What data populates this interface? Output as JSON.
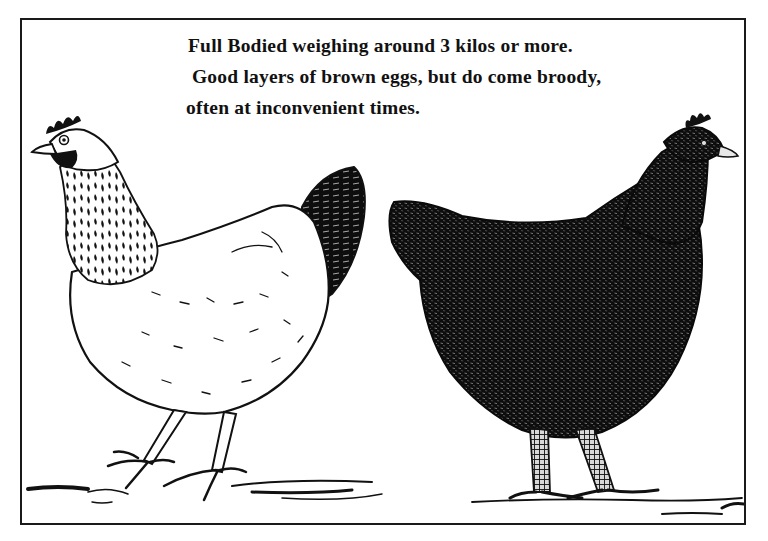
{
  "illustration": {
    "caption": {
      "line1": "Full Bodied weighing around 3 kilos or more.",
      "line2": "Good layers of brown eggs, but do come broody,",
      "line3": "often at inconvenient times."
    },
    "figures": [
      {
        "name": "light-speckled-hen",
        "description": "white-bodied hen with speckled black hackle and black tail, facing left"
      },
      {
        "name": "black-hen",
        "description": "all-black hen facing right"
      }
    ],
    "colors": {
      "ink": "#111111",
      "paper": "#ffffff",
      "frame": "#1a1a1a"
    }
  }
}
